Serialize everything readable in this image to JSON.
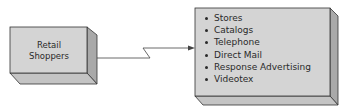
{
  "diagram": {
    "source_box": {
      "label_line1": "Retail",
      "label_line2": "Shoppers"
    },
    "target_box": {
      "items": [
        "Stores",
        "Catalogs",
        "Telephone",
        "Direct Mail",
        "Response Advertising",
        "Videotex"
      ]
    },
    "connector": {
      "style": "lightning-arrow",
      "direction": "source-to-target"
    },
    "colors": {
      "front": "#d4d4d4",
      "side": "#a9a9a9",
      "bottom": "#c4c4c4",
      "stroke": "#333333"
    }
  }
}
